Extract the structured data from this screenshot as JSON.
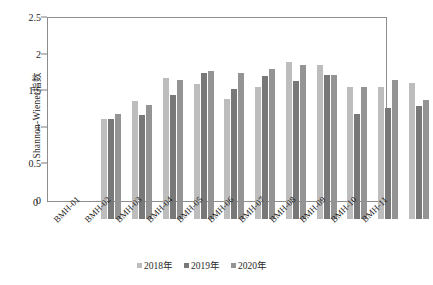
{
  "chart_data": {
    "type": "bar",
    "title": "",
    "xlabel": "",
    "ylabel": "Shannon-Wiener指数",
    "ylim": [
      0,
      2.5
    ],
    "ytick_labels": [
      "0",
      "0.5",
      "1",
      "1.5",
      "2",
      "2.5"
    ],
    "ytick_values": [
      0,
      0.5,
      1,
      1.5,
      2,
      2.5
    ],
    "grid": false,
    "legend_position": "bottom-center",
    "categories": [
      "BMH-01",
      "BMH-02",
      "BMH-03",
      "BMH-04",
      "BMH-05",
      "BMH-06",
      "BMH-07",
      "BMH-08",
      "BMH-09",
      "BMH-10",
      "BMH-11"
    ],
    "series": [
      {
        "name": "2018年",
        "color": "#bdbdbd",
        "values": [
          1.37,
          1.61,
          1.92,
          1.85,
          1.64,
          1.8,
          2.15,
          2.1,
          1.8,
          1.81,
          1.86
        ]
      },
      {
        "name": "2019年",
        "color": "#787878",
        "values": [
          1.37,
          1.42,
          1.7,
          2.0,
          1.77,
          1.95,
          1.88,
          1.97,
          1.44,
          1.52,
          1.55
        ]
      },
      {
        "name": "2020年",
        "color": "#949494",
        "values": [
          1.44,
          1.56,
          1.9,
          2.02,
          2.0,
          2.05,
          2.1,
          1.97,
          1.81,
          1.9,
          1.62
        ]
      }
    ]
  },
  "axis": {
    "origin_label": "0"
  }
}
